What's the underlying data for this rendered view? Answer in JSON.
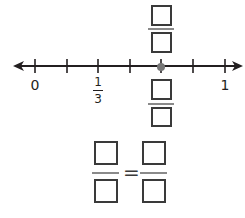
{
  "number_line": {
    "min": 0,
    "max": 1,
    "divisions": 6,
    "tick_values": [
      "0",
      "1/6",
      "2/6",
      "3/6",
      "4/6",
      "5/6",
      "1"
    ],
    "labels": {
      "zero": "0",
      "one_third": {
        "numerator": "1",
        "denominator": "3"
      },
      "one": "1"
    },
    "marked_point": {
      "position": "4/6",
      "description": "gray dot"
    },
    "arrows": "both ends"
  },
  "answer_boxes": {
    "above_point": {
      "numerator": "",
      "denominator": ""
    },
    "below_point": {
      "numerator": "",
      "denominator": ""
    },
    "equation": {
      "left": {
        "numerator": "",
        "denominator": ""
      },
      "operator": "=",
      "right": {
        "numerator": "",
        "denominator": ""
      }
    }
  },
  "colors": {
    "line": "#231f20",
    "point": "#777777",
    "box_border": "#3a3a3a",
    "fraction_bar": "#8a8a8a"
  }
}
